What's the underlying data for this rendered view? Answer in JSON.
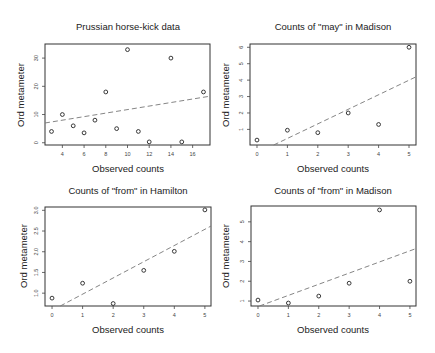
{
  "chart_data": [
    {
      "type": "scatter",
      "title": "Prussian horse-kick data",
      "xlabel": "Observed counts",
      "ylabel": "Ord metameter",
      "xticks": [
        4,
        6,
        8,
        10,
        12,
        14,
        16
      ],
      "yticks": [
        0,
        10,
        20,
        30
      ],
      "xlim": [
        2.4,
        17.6
      ],
      "ylim": [
        -0.8,
        35
      ],
      "points": [
        [
          3,
          4
        ],
        [
          4,
          10
        ],
        [
          5,
          6
        ],
        [
          6,
          3.5
        ],
        [
          7,
          8
        ],
        [
          8,
          18
        ],
        [
          9,
          5
        ],
        [
          10,
          33
        ],
        [
          11,
          4
        ],
        [
          12,
          0.3
        ],
        [
          14,
          30
        ],
        [
          15,
          0.3
        ],
        [
          17,
          18
        ]
      ],
      "fit_line": {
        "style": "dashed",
        "from": [
          2.4,
          7
        ],
        "to": [
          17.6,
          16.5
        ]
      },
      "box": {
        "x0": 45,
        "y0": 44,
        "x1": 210,
        "y1": 145
      }
    },
    {
      "type": "scatter",
      "title": "Counts of \"may\" in Madison",
      "xlabel": "Observed counts",
      "ylabel": "Ord metameter",
      "xticks": [
        0,
        1,
        2,
        3,
        4,
        5
      ],
      "yticks": [
        1,
        2,
        3,
        4,
        5,
        6
      ],
      "xlim": [
        -0.23,
        5.23
      ],
      "ylim": [
        0.05,
        6.2
      ],
      "points": [
        [
          0,
          0.35
        ],
        [
          1,
          0.95
        ],
        [
          2,
          0.8
        ],
        [
          3,
          2.0
        ],
        [
          4,
          1.3
        ],
        [
          5,
          6.0
        ]
      ],
      "fit_line": {
        "style": "dashed",
        "from": [
          0.55,
          0.05
        ],
        "to": [
          5.23,
          4.2
        ]
      },
      "box": {
        "x0": 250,
        "y0": 44,
        "x1": 416,
        "y1": 145
      }
    },
    {
      "type": "scatter",
      "title": "Counts of \"from\" in Hamilton",
      "xlabel": "Observed counts",
      "ylabel": "Ord metameter",
      "xticks": [
        0,
        1,
        2,
        3,
        4,
        5
      ],
      "yticks": [
        1.0,
        1.5,
        2.0,
        2.5,
        3.0
      ],
      "ytick_labels": [
        "1.0",
        "1.5",
        "2.0",
        "2.5",
        "3.0"
      ],
      "xlim": [
        -0.23,
        5.2
      ],
      "ylim": [
        0.69,
        3.08
      ],
      "points": [
        [
          0,
          0.88
        ],
        [
          1,
          1.24
        ],
        [
          2,
          0.75
        ],
        [
          3,
          1.55
        ],
        [
          4,
          2.01
        ],
        [
          5,
          3.01
        ]
      ],
      "fit_line": {
        "style": "dashed",
        "from": [
          0.27,
          0.69
        ],
        "to": [
          5.2,
          2.62
        ]
      },
      "box": {
        "x0": 45,
        "y0": 207,
        "x1": 211,
        "y1": 306
      }
    },
    {
      "type": "scatter",
      "title": "Counts of \"from\" in Madison",
      "xlabel": "Observed counts",
      "ylabel": "Ord metameter",
      "xticks": [
        0,
        1,
        2,
        3,
        4,
        5
      ],
      "yticks": [
        1,
        2,
        3,
        4,
        5
      ],
      "xlim": [
        -0.23,
        5.2
      ],
      "ylim": [
        0.75,
        5.8
      ],
      "points": [
        [
          0,
          1.05
        ],
        [
          1,
          0.9
        ],
        [
          2,
          1.25
        ],
        [
          3,
          1.9
        ],
        [
          4,
          5.6
        ],
        [
          5,
          2.0
        ]
      ],
      "fit_line": {
        "style": "dashed",
        "from": [
          0.05,
          0.75
        ],
        "to": [
          5.2,
          3.65
        ]
      },
      "box": {
        "x0": 251,
        "y0": 206,
        "x1": 416,
        "y1": 306
      }
    }
  ]
}
